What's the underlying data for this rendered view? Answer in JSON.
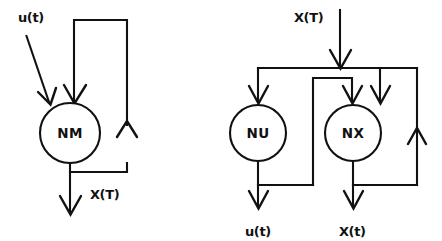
{
  "figure": {
    "background_color": "#ffffff",
    "stroke_color": "#111111",
    "panel_count": 2
  },
  "diagrams": [
    {
      "id": "single-network-model",
      "name": "NM recurrent model",
      "nodes": [
        {
          "id": "nm",
          "label": "NM",
          "shape": "circle",
          "cx": 70,
          "cy": 133,
          "r": 30
        }
      ],
      "signals": [
        {
          "id": "u-in",
          "label": "u(t)",
          "role": "input",
          "label_x": 18,
          "label_y": 22
        },
        {
          "id": "x-out",
          "label": "X(T)",
          "role": "output",
          "label_x": 90,
          "label_y": 199
        }
      ],
      "feedback": {
        "present": true,
        "description": "Output X(T) fed back into NM input"
      }
    },
    {
      "id": "dual-network-model",
      "name": "NU / NX recurrent model",
      "nodes": [
        {
          "id": "nu",
          "label": "NU",
          "shape": "circle",
          "cx": 258,
          "cy": 133,
          "r": 28
        },
        {
          "id": "nx",
          "label": "NX",
          "shape": "circle",
          "cx": 353,
          "cy": 133,
          "r": 28
        }
      ],
      "signals": [
        {
          "id": "x-in",
          "label": "X(T)",
          "role": "input",
          "label_x": 294,
          "label_y": 22
        },
        {
          "id": "u-out",
          "label": "u(t)",
          "role": "output",
          "label_x": 245,
          "label_y": 236
        },
        {
          "id": "x-out",
          "label": "X(t)",
          "role": "output",
          "label_x": 339,
          "label_y": 236
        }
      ],
      "feedback": {
        "present": true,
        "description": "NU output feeds NX input; NX output feeds back to NX input"
      }
    }
  ]
}
